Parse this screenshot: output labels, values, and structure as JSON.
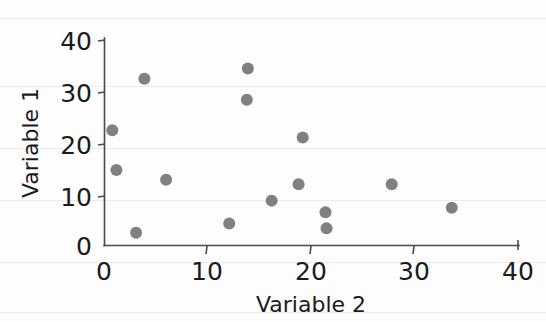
{
  "chart_data": {
    "type": "scatter",
    "title": "",
    "xlabel": "Variable 2",
    "ylabel": "Variable 1",
    "xlim": [
      0,
      40
    ],
    "ylim": [
      0,
      40
    ],
    "xticks": [
      0,
      10,
      20,
      30,
      40
    ],
    "yticks": [
      0,
      10,
      20,
      30,
      40
    ],
    "xtick_labels": [
      "0",
      "10",
      "20",
      "30",
      "40"
    ],
    "ytick_labels": [
      "0",
      "10",
      "20",
      "30",
      "40"
    ],
    "grid": false,
    "legend": null,
    "marker_color": "#808080",
    "marker_size": 11,
    "n_points": 16,
    "points": [
      {
        "x": 0.8,
        "y": 22.5
      },
      {
        "x": 1.2,
        "y": 14.7
      },
      {
        "x": 3.1,
        "y": 2.4
      },
      {
        "x": 3.9,
        "y": 32.6
      },
      {
        "x": 6.0,
        "y": 12.8
      },
      {
        "x": 12.1,
        "y": 4.2
      },
      {
        "x": 13.9,
        "y": 34.6
      },
      {
        "x": 13.8,
        "y": 28.5
      },
      {
        "x": 16.2,
        "y": 8.7
      },
      {
        "x": 18.8,
        "y": 11.9
      },
      {
        "x": 19.2,
        "y": 21.1
      },
      {
        "x": 21.4,
        "y": 6.4
      },
      {
        "x": 21.5,
        "y": 3.3
      },
      {
        "x": 27.8,
        "y": 11.9
      },
      {
        "x": 33.6,
        "y": 7.3
      }
    ]
  },
  "axes": {
    "x_axis_name": "x-axis",
    "y_axis_name": "y-axis"
  }
}
